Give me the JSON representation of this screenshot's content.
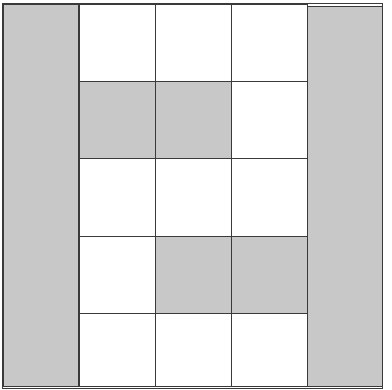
{
  "diagram": {
    "type": "grid-pattern",
    "rows": 5,
    "cols": 5,
    "colors": {
      "shaded": "#c8c8c8",
      "blank": "#ffffff",
      "line": "#3a3a3a"
    },
    "full_height_shaded_columns": [
      0,
      4
    ],
    "cells": [
      [
        "shaded",
        "blank",
        "blank",
        "blank",
        "shaded"
      ],
      [
        "shaded",
        "shaded",
        "shaded",
        "blank",
        "shaded"
      ],
      [
        "shaded",
        "blank",
        "blank",
        "blank",
        "shaded"
      ],
      [
        "shaded",
        "blank",
        "shaded",
        "shaded",
        "shaded"
      ],
      [
        "shaded",
        "blank",
        "blank",
        "blank",
        "shaded"
      ]
    ]
  }
}
